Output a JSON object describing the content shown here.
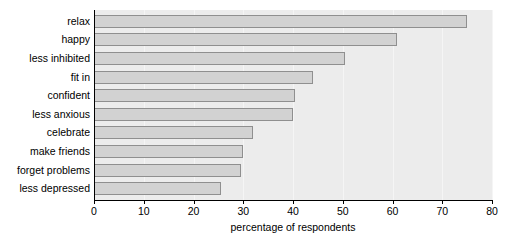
{
  "chart_data": {
    "type": "bar",
    "orientation": "horizontal",
    "title": "",
    "xlabel": "percentage of respondents",
    "ylabel": "",
    "xlim": [
      0,
      80
    ],
    "xticks": [
      0,
      10,
      20,
      30,
      40,
      50,
      60,
      70,
      80
    ],
    "grid": true,
    "legend": null,
    "categories": [
      "relax",
      "happy",
      "less inhibited",
      "fit in",
      "confident",
      "less anxious",
      "celebrate",
      "make friends",
      "forget problems",
      "less depressed"
    ],
    "values": [
      75,
      61,
      50.5,
      44,
      40.5,
      40,
      32,
      30,
      29.5,
      25.5
    ],
    "colors": {
      "bar_fill": "#d2d2d2",
      "bar_border": "#8f8f8f",
      "plot_background": "#ececec",
      "gridline": "#f5f5f5",
      "axis": "#000000",
      "text": "#000000",
      "page_background": "#ffffff"
    }
  }
}
